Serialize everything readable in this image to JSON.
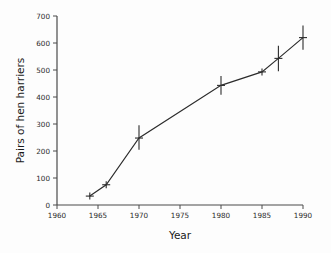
{
  "chart_data": {
    "type": "line",
    "title": "",
    "xlabel": "Year",
    "ylabel": "Pairs of hen harriers",
    "xlim": [
      1960,
      1990
    ],
    "ylim": [
      0,
      700
    ],
    "xticks": [
      1960,
      1965,
      1970,
      1975,
      1980,
      1985,
      1990
    ],
    "xtick_labels": [
      "1960",
      "1965",
      "1970",
      "1975",
      "1980",
      "1985",
      "1990"
    ],
    "yticks": [
      0,
      100,
      200,
      300,
      400,
      500,
      600,
      700
    ],
    "ytick_labels": [
      "0",
      "100",
      "200",
      "300",
      "400",
      "500",
      "600",
      "700"
    ],
    "grid": false,
    "legend": null,
    "marker": "plus",
    "errorbars": true,
    "x": [
      1964,
      1966,
      1970,
      1980,
      1985,
      1987,
      1990
    ],
    "values": [
      33,
      75,
      248,
      443,
      493,
      543,
      620
    ],
    "yerr_low": [
      33,
      75,
      205,
      408,
      493,
      495,
      575
    ],
    "yerr_high": [
      33,
      75,
      295,
      478,
      493,
      590,
      665
    ],
    "points": [
      {
        "x": 1964,
        "y": 33,
        "low": 33,
        "high": 33
      },
      {
        "x": 1966,
        "y": 75,
        "low": 75,
        "high": 75
      },
      {
        "x": 1970,
        "y": 248,
        "low": 205,
        "high": 295
      },
      {
        "x": 1980,
        "y": 443,
        "low": 408,
        "high": 478
      },
      {
        "x": 1985,
        "y": 493,
        "low": 493,
        "high": 493
      },
      {
        "x": 1987,
        "y": 543,
        "low": 495,
        "high": 590
      },
      {
        "x": 1990,
        "y": 620,
        "low": 575,
        "high": 665
      }
    ],
    "colors": {
      "line": "#2c2c2c",
      "axis": "#4a4a4a",
      "background": "#fdfdfd"
    }
  }
}
